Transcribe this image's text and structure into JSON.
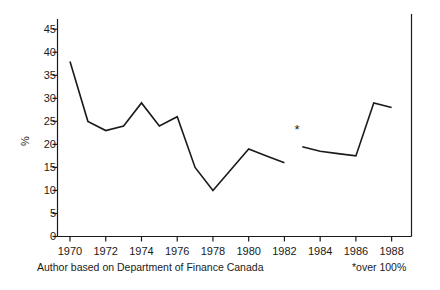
{
  "chart_data": {
    "type": "line",
    "title": "",
    "subtitle": "",
    "xlabel": "",
    "ylabel": "%",
    "xlim": [
      1969.3,
      1989.0
    ],
    "ylim": [
      0,
      47
    ],
    "grid": false,
    "legend": null,
    "x_ticks": [
      1970,
      1972,
      1974,
      1976,
      1978,
      1980,
      1982,
      1984,
      1986,
      1988
    ],
    "x_tick_labels": [
      "1970",
      "1972",
      "1974",
      "1976",
      "1978",
      "1980",
      "1982",
      "1984",
      "1986",
      "1988"
    ],
    "y_ticks": [
      0,
      5,
      10,
      15,
      20,
      25,
      30,
      35,
      40,
      45
    ],
    "y_tick_labels": [
      "0",
      "5",
      "10",
      "15",
      "20",
      "25",
      "30",
      "35",
      "40",
      "45"
    ],
    "series": [
      {
        "name": "segment-1",
        "x": [
          1970,
          1971,
          1972,
          1973,
          1974,
          1975,
          1976,
          1977,
          1978,
          1979,
          1980,
          1981,
          1982
        ],
        "values": [
          38,
          25,
          23,
          24,
          29,
          24,
          26,
          15,
          10,
          14.5,
          19,
          17.5,
          16
        ]
      },
      {
        "name": "segment-2",
        "x": [
          1983,
          1984,
          1985,
          1986,
          1987,
          1988
        ],
        "values": [
          19.5,
          18.5,
          18,
          17.5,
          29,
          28
        ]
      }
    ],
    "annotations": [
      {
        "name": "off-scale-marker",
        "text": "*",
        "x": 1982.7,
        "y": 23.0,
        "note": "over 100%"
      }
    ],
    "line_color": "#1a1a1a",
    "axis_color": "#1a1a1a"
  },
  "caption": {
    "text": "Author based on Department of Finance Canada"
  },
  "footnote": {
    "text": "*over 100%"
  }
}
